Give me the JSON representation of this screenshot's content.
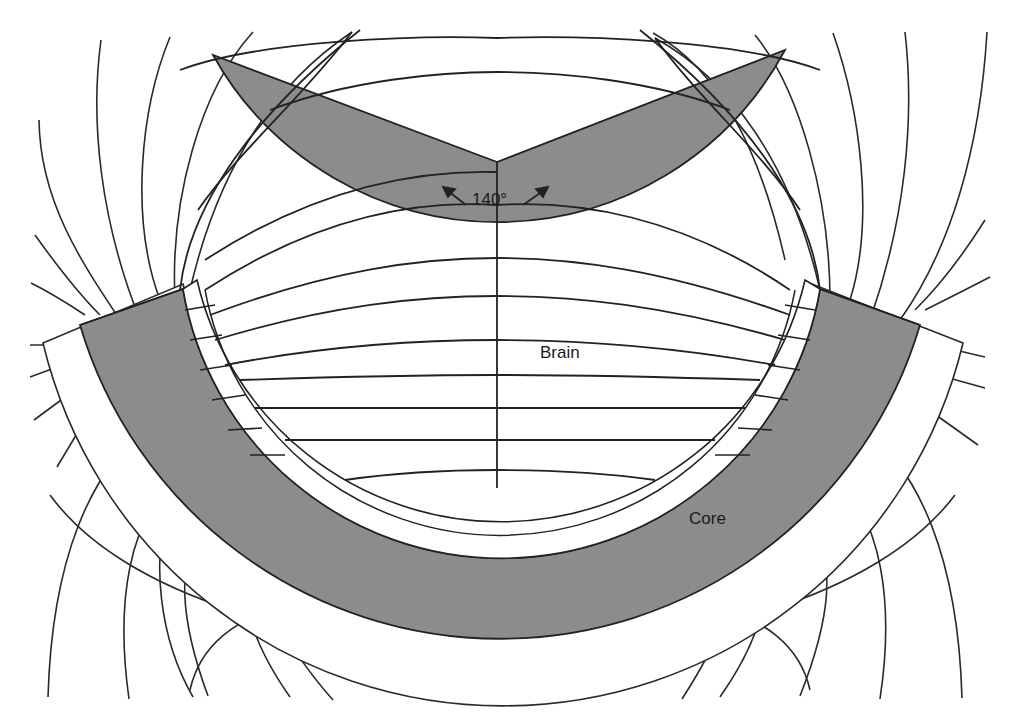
{
  "diagram": {
    "type": "magnetic field geometry cross-section",
    "colors": {
      "background": "#ffffff",
      "region_fill": "#8c8c8c",
      "line": "#222222"
    },
    "labels": {
      "brain": "Brain",
      "core": "Core",
      "angle": "140°"
    },
    "regions": [
      {
        "name": "Brain",
        "shape": "circular sector",
        "opening_angle_deg": 140
      },
      {
        "name": "Core",
        "shape": "annular sector"
      }
    ]
  }
}
